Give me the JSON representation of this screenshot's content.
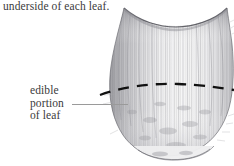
{
  "figure": {
    "type": "botanical-line-illustration",
    "subject": "leaf",
    "background_color": "#ffffff",
    "ink_color": "#3b3b3b",
    "leader_color": "#9a9a9a",
    "dash_color": "#111111"
  },
  "caption": {
    "top_text": "underside of each leaf."
  },
  "callout": {
    "line1": "edible",
    "line2": "portion",
    "line3": "of leaf",
    "leader_label": "leader-line-to-dashed-boundary"
  },
  "annotations": {
    "dashed_boundary_name": "edible-portion-boundary",
    "dashed_boundary_description": "curved dashed arc across the leaf"
  },
  "icons": {
    "leaf": "leaf-illustration-icon"
  }
}
